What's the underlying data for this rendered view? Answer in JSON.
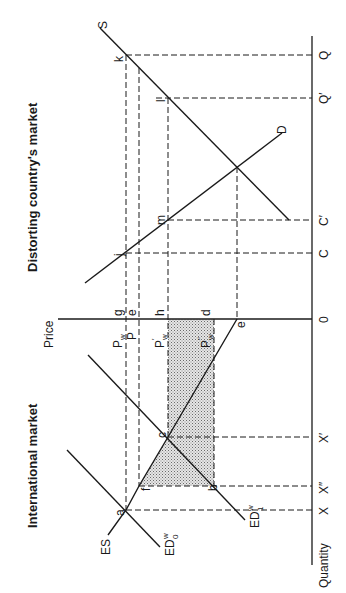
{
  "figure": {
    "orientation": "rotated 90 degrees counter-clockwise",
    "titles": {
      "international": "International market",
      "distorting": "Distorting country's market"
    },
    "axes": {
      "price_label": "Price",
      "quantity_label": "Quantity",
      "origin": "0"
    },
    "quantity_ticks": {
      "x": "X",
      "x_double_prime": "X″",
      "x_prime": "X′",
      "c": "C",
      "c_prime": "C′",
      "q_prime": "Q′",
      "q": "Q"
    },
    "price_ticks": {
      "pw": "P",
      "pw_sub": "w",
      "p": "P",
      "pw_prime": "P",
      "pw_prime_sub": "w",
      "pw_prime_mark": "′",
      "pw_dprime": "P",
      "pw_dprime_sub": "w",
      "pw_dprime_mark": "″"
    },
    "curves": {
      "es": "ES",
      "ed0": "ED",
      "ed0_sup": "w",
      "ed0_sub": "0",
      "ed1": "ED",
      "ed1_sup": "w",
      "ed1_sub": "1",
      "s": "S",
      "d": "D"
    },
    "points": {
      "a": "a",
      "b": "b",
      "c": "c",
      "d": "d",
      "e_price": "e",
      "e_axis": "e",
      "f": "f",
      "g": "g",
      "h": "h",
      "j": "j",
      "k": "k",
      "l": "l",
      "m": "m"
    },
    "colors": {
      "ink": "#1a1a1a",
      "shade": "#b8b8b8",
      "background": "#ffffff"
    }
  }
}
